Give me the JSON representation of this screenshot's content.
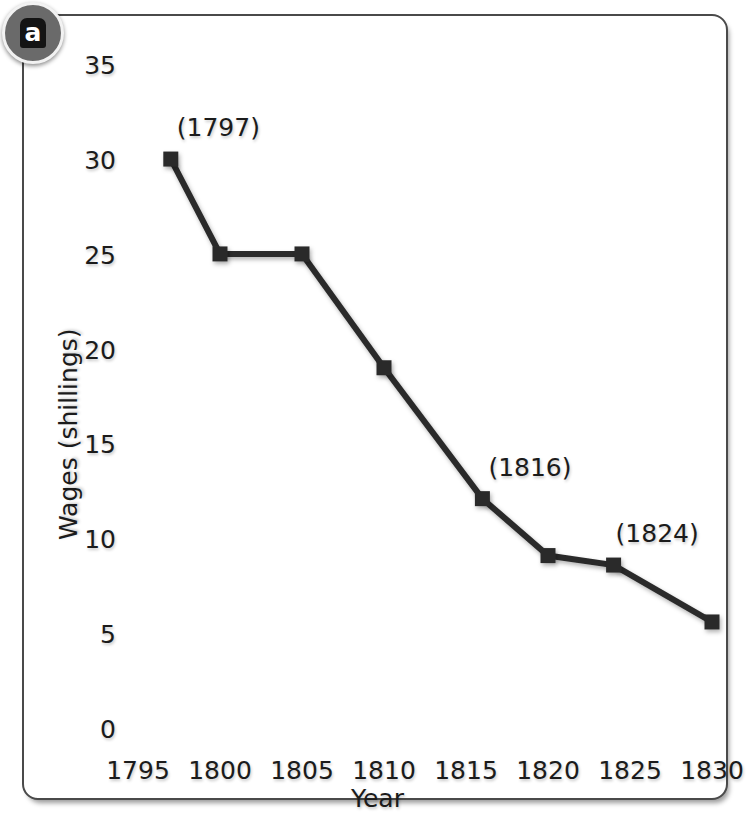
{
  "figure": {
    "panel_label": "a"
  },
  "chart_data": {
    "type": "line",
    "title": "",
    "xlabel": "Year",
    "ylabel": "Wages (shillings)",
    "xlim": [
      1795,
      1830
    ],
    "ylim": [
      0,
      35
    ],
    "xticks": [
      "1795",
      "1800",
      "1805",
      "1810",
      "1815",
      "1820",
      "1825",
      "1830"
    ],
    "yticks": [
      "0",
      "5",
      "10",
      "15",
      "20",
      "25",
      "30",
      "35"
    ],
    "grid": false,
    "legend": "none",
    "marker": "square",
    "line_color": "#2b2b2b",
    "x": [
      1797,
      1800,
      1805,
      1810,
      1816,
      1820,
      1824,
      1830
    ],
    "values": [
      30.2,
      25.2,
      25.2,
      19.2,
      12.3,
      9.3,
      8.8,
      5.8
    ],
    "annotations": [
      {
        "text": "(1797)",
        "x": 1797,
        "y": 30.2
      },
      {
        "text": "(1816)",
        "x": 1816,
        "y": 12.3
      },
      {
        "text": "(1824)",
        "x": 1824,
        "y": 8.8
      }
    ]
  }
}
